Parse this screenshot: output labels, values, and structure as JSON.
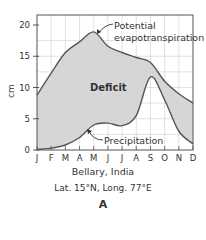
{
  "chart_data": {
    "type": "area",
    "title": "Bellary, India",
    "subtitle": "Lat. 15°N, Long. 77°E",
    "panel_label": "A",
    "xlabel": "",
    "ylabel": "cm",
    "categories": [
      "J",
      "F",
      "M",
      "A",
      "M",
      "J",
      "J",
      "A",
      "S",
      "O",
      "N",
      "D"
    ],
    "ylim": [
      0,
      20
    ],
    "yticks": [
      0,
      5,
      10,
      15,
      20
    ],
    "grid": true,
    "legend": "none (inline annotations)",
    "series": [
      {
        "name": "Potential evapotranspiration",
        "values": [
          8.8,
          12.3,
          15.6,
          17.3,
          18.9,
          16.6,
          15.6,
          14.8,
          14.0,
          11.0,
          9.0,
          7.5
        ]
      },
      {
        "name": "Precipitation",
        "values": [
          0.1,
          0.3,
          0.8,
          2.0,
          4.0,
          4.3,
          3.9,
          5.5,
          11.7,
          8.0,
          3.0,
          1.0
        ]
      }
    ],
    "annotations": [
      {
        "text": "Potential evapotranspiration",
        "target": "PET peak (May)"
      },
      {
        "text": "Precipitation",
        "target": "Precipitation curve (Apr–May)"
      },
      {
        "text": "Deficit",
        "region": "area between PET and precipitation"
      }
    ],
    "colors": {
      "deficit_fill": "#d6d6d6",
      "surplus_fill": "#ffffff",
      "curve": "#555555",
      "grid": "#cfcfcf",
      "frame": "#555555"
    }
  },
  "labels": {
    "y_axis_title": "cm",
    "deficit": "Deficit",
    "pet_line1": "Potential",
    "pet_line2": "evapotranspiration",
    "precip": "Precipitation",
    "location": "Bellary, India",
    "coords": "Lat. 15°N, Long. 77°E",
    "panel": "A"
  }
}
